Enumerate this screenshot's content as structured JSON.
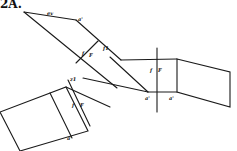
{
  "figure": {
    "title": "2A.",
    "stroke_color": "#1a1a1a",
    "labels": {
      "ev": "ev",
      "a1_top": "a'",
      "f": "f",
      "F": "F",
      "f1": "f1",
      "z1": "z1",
      "f_right": "f",
      "F_right": "F",
      "a_left": "a'",
      "a_right": "a'",
      "f_bottom": "f",
      "F_bottom": "F",
      "a_bottom": "a'"
    }
  }
}
